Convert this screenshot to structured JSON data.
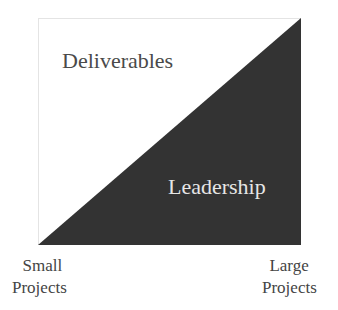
{
  "diagram": {
    "top_label": "Deliverables",
    "bottom_label": "Leadership",
    "left_axis": {
      "line1": "Small",
      "line2": "Projects"
    },
    "right_axis": {
      "line1": "Large",
      "line2": "Projects"
    },
    "colors": {
      "triangle": "#333333",
      "background": "#ffffff"
    }
  }
}
